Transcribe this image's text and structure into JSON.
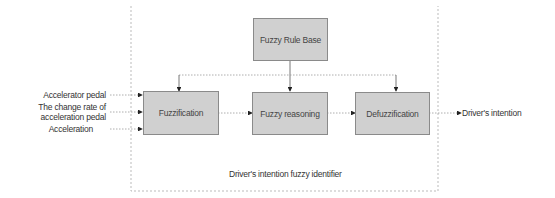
{
  "diagram": {
    "container_label": "Driver's intention fuzzy identifier",
    "nodes": {
      "rule_base": "Fuzzy Rule Base",
      "fuzzification": "Fuzzification",
      "reasoning": "Fuzzy reasoning",
      "defuzzification": "Defuzzification"
    },
    "inputs": [
      "Accelerator pedal",
      "The change rate of",
      "acceleration pedal",
      "Acceleration"
    ],
    "output": "Driver's intention",
    "edges": [
      {
        "from": "Accelerator pedal",
        "to": "Fuzzification"
      },
      {
        "from": "The change rate of acceleration pedal",
        "to": "Fuzzification"
      },
      {
        "from": "Acceleration",
        "to": "Fuzzification"
      },
      {
        "from": "Fuzzy Rule Base",
        "to": "Fuzzification"
      },
      {
        "from": "Fuzzy Rule Base",
        "to": "Fuzzy reasoning"
      },
      {
        "from": "Fuzzy Rule Base",
        "to": "Defuzzification"
      },
      {
        "from": "Fuzzification",
        "to": "Fuzzy reasoning"
      },
      {
        "from": "Fuzzy reasoning",
        "to": "Defuzzification"
      },
      {
        "from": "Defuzzification",
        "to": "Driver's intention"
      }
    ]
  }
}
